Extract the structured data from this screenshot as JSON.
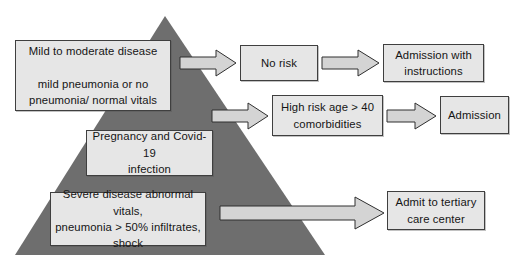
{
  "diagram": {
    "type": "flowchart-pyramid",
    "colors": {
      "triangle_fill": "#6e6e6e",
      "box_fill": "#e6e6e6",
      "box_border": "#3f3f3f",
      "arrow_fill": "#d4d4d4",
      "arrow_border": "#2f2f2f",
      "text": "#151515",
      "background": "#ffffff"
    },
    "shapes": {
      "pyramid_label": "severity pyramid"
    },
    "nodes": [
      {
        "id": "mild",
        "name": "mild-to-moderate-disease",
        "text": "Mild to moderate disease\n\nmild pneumonia or no\npneumonia/ normal vitals"
      },
      {
        "id": "pregnancy",
        "name": "pregnancy-and-covid-19-infection",
        "text": "Pregnancy and Covid-19\ninfection"
      },
      {
        "id": "severe",
        "name": "severe-disease",
        "text": "Severe disease abnormal vitals,\npneumonia > 50% infiltrates,\nshock"
      },
      {
        "id": "norisk",
        "name": "no-risk",
        "text": "No risk"
      },
      {
        "id": "admission_instructions",
        "name": "admission-with-instructions",
        "text": "Admission with\ninstructions"
      },
      {
        "id": "highrisk",
        "name": "high-risk-age-over-40-comorbidities",
        "text": "High risk age > 40\ncomorbidities"
      },
      {
        "id": "admission",
        "name": "admission",
        "text": "Admission"
      },
      {
        "id": "tertiary",
        "name": "admit-to-tertiary-care-center",
        "text": "Admit to tertiary\ncare center"
      }
    ],
    "edges": [
      {
        "id": "e1",
        "from": "mild",
        "to": "norisk",
        "label": ""
      },
      {
        "id": "e2",
        "from": "norisk",
        "to": "admission_instructions",
        "label": ""
      },
      {
        "id": "e3",
        "from": "mild",
        "to": "highrisk",
        "label": ""
      },
      {
        "id": "e4",
        "from": "highrisk",
        "to": "admission",
        "label": ""
      },
      {
        "id": "e5",
        "from": "severe",
        "to": "tertiary",
        "label": ""
      }
    ]
  }
}
